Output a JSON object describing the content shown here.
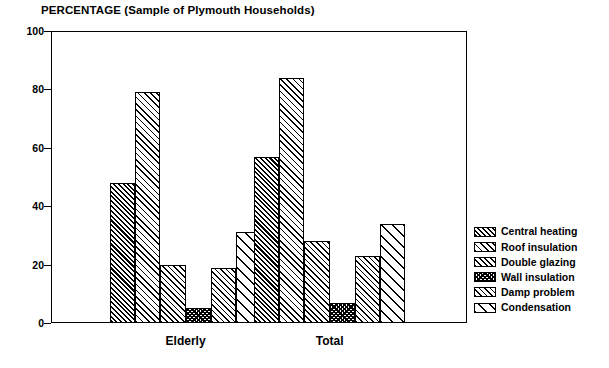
{
  "chart_data": {
    "type": "bar",
    "title": "PERCENTAGE (Sample of Plymouth Households)",
    "xlabel": "",
    "ylabel": "",
    "ylim": [
      0,
      100
    ],
    "yticks": [
      0,
      20,
      40,
      60,
      80,
      100
    ],
    "grid": false,
    "legend_position": "right",
    "categories": [
      "Elderly",
      "Total"
    ],
    "series": [
      {
        "name": "Central heating",
        "values": [
          48,
          57
        ],
        "pattern": "dense-diagonal"
      },
      {
        "name": "Roof insulation",
        "values": [
          79,
          84
        ],
        "pattern": "light-diagonal"
      },
      {
        "name": "Double glazing",
        "values": [
          20,
          28
        ],
        "pattern": "medium-diagonal"
      },
      {
        "name": "Wall insulation",
        "values": [
          5,
          7
        ],
        "pattern": "crosshatch"
      },
      {
        "name": "Damp problem",
        "values": [
          19,
          23
        ],
        "pattern": "medium-diagonal"
      },
      {
        "name": "Condensation",
        "values": [
          31,
          34
        ],
        "pattern": "wide-diagonal"
      }
    ]
  },
  "legend": {
    "items": [
      {
        "label": "Central heating"
      },
      {
        "label": "Roof insulation"
      },
      {
        "label": "Double glazing"
      },
      {
        "label": "Wall insulation"
      },
      {
        "label": "Damp problem"
      },
      {
        "label": "Condensation"
      }
    ]
  },
  "colors": {
    "ink": "#000000",
    "background": "#ffffff"
  }
}
